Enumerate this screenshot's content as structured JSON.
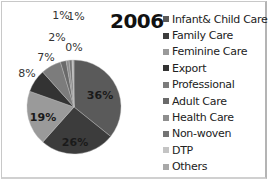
{
  "chart_data": {
    "type": "pie",
    "title": "2006",
    "categories": [
      "Infant& Child Care",
      "Family Care",
      "Feminine Care",
      "Export",
      "Professional",
      "Adult Care",
      "Health Care",
      "Non-woven",
      "DTP",
      "Others"
    ],
    "values": [
      36,
      26,
      19,
      8,
      7,
      2,
      1,
      1,
      0,
      0
    ],
    "value_labels": [
      "36%",
      "26%",
      "19%",
      "8%",
      "7%",
      "2%",
      "1%",
      "1%",
      "0%",
      "0%"
    ],
    "colors": [
      "#5a5a5a",
      "#3c3c3c",
      "#9a9a9a",
      "#333333",
      "#7c7c7c",
      "#6a6a6a",
      "#8e8e8e",
      "#747474",
      "#c4c4c4",
      "#a8a8a8"
    ],
    "start_angle_deg": 0,
    "direction": "clockwise",
    "legend_position": "right",
    "xlabel": "",
    "ylabel": ""
  },
  "title": "2006",
  "legend": [
    {
      "label": "Infant& Child Care",
      "color": "#5a5a5a"
    },
    {
      "label": "Family Care",
      "color": "#3c3c3c"
    },
    {
      "label": "Feminine Care",
      "color": "#9a9a9a"
    },
    {
      "label": "Export",
      "color": "#333333"
    },
    {
      "label": "Professional",
      "color": "#7c7c7c"
    },
    {
      "label": "Adult Care",
      "color": "#6a6a6a"
    },
    {
      "label": "Health Care",
      "color": "#8e8e8e"
    },
    {
      "label": "Non-woven",
      "color": "#747474"
    },
    {
      "label": "DTP",
      "color": "#c4c4c4"
    },
    {
      "label": "Others",
      "color": "#a8a8a8"
    }
  ],
  "labels": {
    "infant": "36%",
    "family": "26%",
    "feminine": "19%",
    "export": "8%",
    "professional": "7%",
    "adult": "2%",
    "health": "1%",
    "nonwoven": "1%",
    "dtp": "0%",
    "others": "0%"
  }
}
